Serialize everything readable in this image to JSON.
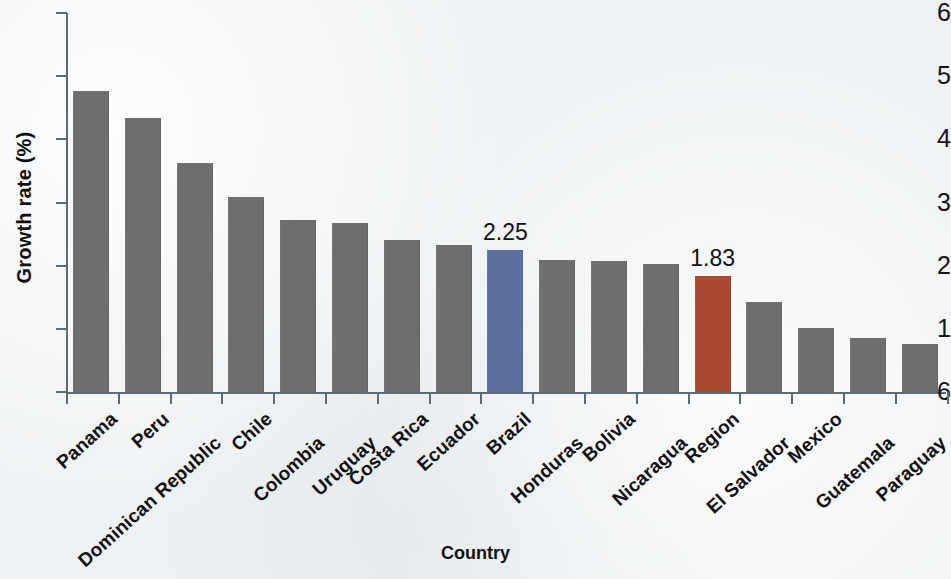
{
  "chart_data": {
    "type": "bar",
    "title": "",
    "xlabel": "Country",
    "ylabel": "Growth rate (%)",
    "ylim": [
      0,
      6
    ],
    "ytick_labels": [
      "6",
      "5",
      "4",
      "3",
      "2",
      "1",
      "6"
    ],
    "ytick_values": [
      6,
      5,
      4,
      3,
      2,
      1,
      0
    ],
    "grid": false,
    "legend": "none",
    "categories": [
      "Panama",
      "Peru",
      "Dominican Republic",
      "Chile",
      "Colombia",
      "Uruguay",
      "Costa Rica",
      "Ecuador",
      "Brazil",
      "Honduras",
      "Bolivia",
      "Nicaragua",
      "Region",
      "El Salvador",
      "Mexico",
      "Guatemala",
      "Paraguay"
    ],
    "values": [
      4.76,
      4.33,
      3.63,
      3.09,
      2.72,
      2.68,
      2.41,
      2.32,
      2.25,
      2.09,
      2.07,
      2.03,
      1.83,
      1.42,
      1.02,
      0.85,
      0.76
    ],
    "bar_colors": [
      "#6e6e6e",
      "#6e6e6e",
      "#6e6e6e",
      "#6e6e6e",
      "#6e6e6e",
      "#6e6e6e",
      "#6e6e6e",
      "#6e6e6e",
      "#5c6f9a",
      "#6e6e6e",
      "#6e6e6e",
      "#6e6e6e",
      "#a9492f",
      "#6e6e6e",
      "#6e6e6e",
      "#6e6e6e",
      "#6e6e6e"
    ],
    "data_labels": [
      {
        "category": "Brazil",
        "text": "2.25"
      },
      {
        "category": "Region",
        "text": "1.83"
      }
    ],
    "colors": {
      "default_bar": "#6e6e6e",
      "brazil_bar": "#5c6f9a",
      "region_bar": "#a9492f",
      "axis": "#5d6b74",
      "background": "#eef1f3",
      "text": "#111111"
    }
  }
}
